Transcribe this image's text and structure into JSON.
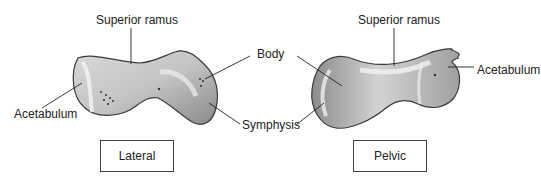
{
  "figure": {
    "left_view": {
      "caption": "Lateral",
      "labels": {
        "superior_ramus": "Superior ramus",
        "acetabulum": "Acetabulum",
        "body": "Body",
        "symphysis": "Symphysis"
      }
    },
    "right_view": {
      "caption": "Pelvic",
      "labels": {
        "superior_ramus": "Superior ramus",
        "acetabulum": "Acetabulum"
      }
    },
    "colors": {
      "bone_light": "#e6e6e6",
      "bone_mid": "#b4b4b4",
      "bone_dark": "#6e6e6e",
      "outline": "#3a3a3a",
      "leader": "#222222"
    }
  }
}
